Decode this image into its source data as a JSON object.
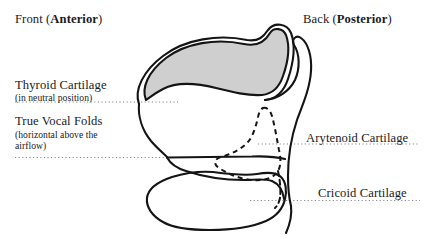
{
  "figure": {
    "type": "anatomical-diagram",
    "orientation_labels": {
      "left": {
        "plain": "Front (",
        "emphasis": "Anterior",
        "close": ")"
      },
      "right": {
        "plain": "Back (",
        "emphasis": "Posterior",
        "close": ")"
      }
    },
    "labels": [
      {
        "id": "thyroid",
        "title": "Thyroid Cartilage",
        "subtitle": "(in neutral position)",
        "side": "left",
        "leader_y": 102
      },
      {
        "id": "true-vocal-folds",
        "title": "True Vocal Folds",
        "subtitle": "(horizontal above the airflow)",
        "side": "left",
        "leader_y": 157
      },
      {
        "id": "arytenoid",
        "title": "Arytenoid Cartilage",
        "subtitle": "",
        "side": "right",
        "leader_y": 144
      },
      {
        "id": "cricoid",
        "title": "Cricoid Cartilage",
        "subtitle": "",
        "side": "right",
        "leader_y": 200
      }
    ],
    "colors": {
      "stroke": "#141414",
      "thyroid_fill": "#cfcfcf",
      "background": "#ffffff",
      "leader_dots": "#8a8a8a"
    },
    "strokes": {
      "outline_width": 2.0,
      "thyroid_outline_width": 2.0,
      "dashed_width": 2.0,
      "dash_pattern": "5 4"
    }
  }
}
